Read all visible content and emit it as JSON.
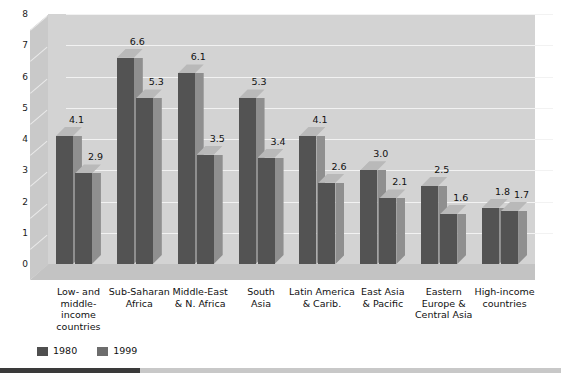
{
  "chart_data": {
    "type": "bar",
    "title": "",
    "subtitle": "",
    "xlabel": "",
    "ylabel": "",
    "ylim": [
      0,
      8
    ],
    "yticks": [
      "8",
      "7",
      "6",
      "5",
      "4",
      "3",
      "2",
      "1",
      "0"
    ],
    "grid": true,
    "legend_position": "bottom-left",
    "threeD": true,
    "categories": [
      "Low- and middle-income countries",
      "Sub-Saharan Africa",
      "Middle-East & N. Africa",
      "South Asia",
      "Latin America & Carib.",
      "East Asia & Pacific",
      "Eastern Europe & Central Asia",
      "High-income countries"
    ],
    "category_lines": [
      [
        "Low- and",
        "middle-",
        "income",
        "countries"
      ],
      [
        "Sub-Saharan",
        "Africa"
      ],
      [
        "Middle-East",
        "& N. Africa"
      ],
      [
        "South",
        "Asia"
      ],
      [
        "Latin America",
        "& Carib."
      ],
      [
        "East Asia",
        "& Pacific"
      ],
      [
        "Eastern",
        "Europe &",
        "Central Asia"
      ],
      [
        "High-income",
        "countries"
      ]
    ],
    "series": [
      {
        "name": "1980",
        "color": "#535353",
        "values": [
          4.1,
          6.6,
          6.1,
          5.3,
          4.1,
          3.0,
          2.5,
          1.8
        ],
        "labels": [
          "4.1",
          "6.6",
          "6.1",
          "5.3",
          "4.1",
          "3.0",
          "2.5",
          "1.8"
        ]
      },
      {
        "name": "1999",
        "color": "#535353",
        "values": [
          2.9,
          5.3,
          3.5,
          3.4,
          2.6,
          2.1,
          1.6,
          1.7
        ],
        "labels": [
          "2.9",
          "5.3",
          "3.5",
          "3.4",
          "2.6",
          "2.1",
          "1.6",
          "1.7"
        ]
      }
    ]
  },
  "legend": {
    "items": [
      {
        "label": "1980",
        "swatch": "#4f4f4f"
      },
      {
        "label": "1999",
        "swatch": "#6d6d6d"
      }
    ]
  },
  "colors": {
    "panel": "#d3d3d3",
    "floor": "#c3c3c3",
    "sidewall": "#c9c9c9",
    "gridline": "#f2f2f2",
    "bar_front": "#535353",
    "bar_side": "#8f8f8f",
    "bar_top": "#b9b9b9",
    "text": "#111111",
    "background": "#ffffff",
    "footer_bar": "#3a3a3a"
  }
}
